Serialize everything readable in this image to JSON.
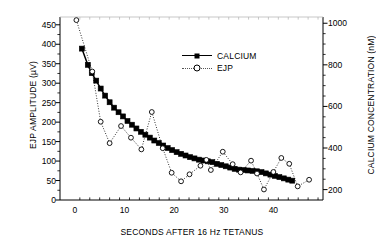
{
  "chart_data": {
    "type": "line",
    "title": "",
    "xlabel": "SECONDS AFTER 16 Hz TETANUS",
    "ylabel": "EJP AMPLITUDE  (µV)",
    "y2label": "CALCIUM CONCENTRATION  (nM)",
    "xlim": [
      -3,
      50
    ],
    "ylim": [
      0,
      470
    ],
    "y2lim": [
      150,
      1030
    ],
    "grid": false,
    "legend_position": "upper-right-inside",
    "xticks": [
      0,
      10,
      20,
      30,
      40
    ],
    "xtick_labels": [
      "0",
      "10",
      "20",
      "30",
      "40"
    ],
    "xminor_step": 2,
    "yticks": [
      0,
      50,
      100,
      150,
      200,
      250,
      300,
      350,
      400,
      450
    ],
    "ytick_labels": [
      "0",
      "50",
      "100",
      "150",
      "200",
      "250",
      "300",
      "350",
      "400",
      "450"
    ],
    "y2ticks": [
      200,
      400,
      600,
      800,
      1000
    ],
    "y2tick_labels": [
      "200",
      "400",
      "600",
      "800",
      "1000"
    ],
    "series": [
      {
        "name": "CALCIUM",
        "axis": "right",
        "marker": "filled-square",
        "line": "solid",
        "color": "#000000",
        "points": [
          [
            1.4,
            878
          ],
          [
            2.6,
            800
          ],
          [
            3.4,
            760
          ],
          [
            4.3,
            724
          ],
          [
            5.2,
            686
          ],
          [
            6.1,
            652
          ],
          [
            7.0,
            620
          ],
          [
            7.9,
            594
          ],
          [
            8.8,
            572
          ],
          [
            9.7,
            552
          ],
          [
            10.6,
            530
          ],
          [
            11.5,
            512
          ],
          [
            12.4,
            494
          ],
          [
            13.3,
            478
          ],
          [
            14.2,
            464
          ],
          [
            15.1,
            450
          ],
          [
            16.0,
            436
          ],
          [
            16.9,
            424
          ],
          [
            17.8,
            412
          ],
          [
            18.7,
            400
          ],
          [
            19.6,
            390
          ],
          [
            20.5,
            380
          ],
          [
            21.4,
            372
          ],
          [
            22.3,
            364
          ],
          [
            23.2,
            356
          ],
          [
            24.1,
            350
          ],
          [
            25.0,
            344
          ],
          [
            25.9,
            340
          ],
          [
            26.8,
            336
          ],
          [
            27.7,
            332
          ],
          [
            28.6,
            324
          ],
          [
            29.5,
            318
          ],
          [
            30.4,
            312
          ],
          [
            31.3,
            306
          ],
          [
            32.2,
            300
          ],
          [
            33.1,
            296
          ],
          [
            34.0,
            294
          ],
          [
            34.9,
            292
          ],
          [
            35.8,
            290
          ],
          [
            36.7,
            288
          ],
          [
            37.6,
            284
          ],
          [
            38.5,
            278
          ],
          [
            39.4,
            272
          ],
          [
            40.3,
            266
          ],
          [
            41.2,
            260
          ],
          [
            42.1,
            254
          ],
          [
            43.0,
            248
          ],
          [
            43.8,
            243
          ]
        ]
      },
      {
        "name": "EJP",
        "axis": "left",
        "marker": "open-circle",
        "line": "dotted",
        "color": "#000000",
        "points": [
          [
            0.3,
            462
          ],
          [
            3.5,
            330
          ],
          [
            5.2,
            201
          ],
          [
            7.0,
            146
          ],
          [
            9.3,
            190
          ],
          [
            11.3,
            160
          ],
          [
            13.4,
            130
          ],
          [
            15.5,
            226
          ],
          [
            17.7,
            133
          ],
          [
            19.5,
            70
          ],
          [
            21.4,
            48
          ],
          [
            23.1,
            66
          ],
          [
            25.3,
            88
          ],
          [
            26.5,
            103
          ],
          [
            27.4,
            77
          ],
          [
            29.8,
            124
          ],
          [
            31.8,
            92
          ],
          [
            33.4,
            71
          ],
          [
            35.5,
            101
          ],
          [
            36.7,
            68
          ],
          [
            38.1,
            27
          ],
          [
            40.0,
            72
          ],
          [
            41.6,
            108
          ],
          [
            43.2,
            93
          ],
          [
            44.9,
            35
          ],
          [
            47.2,
            52
          ]
        ]
      }
    ]
  },
  "legend": {
    "items": [
      {
        "label": "CALCIUM",
        "marker": "filled-square",
        "line": "solid"
      },
      {
        "label": "EJP",
        "marker": "open-circle",
        "line": "dotted"
      }
    ]
  },
  "axis_titles": {
    "left": "EJP AMPLITUDE  (µV)",
    "right": "CALCIUM CONCENTRATION  (nM)",
    "bottom": "SECONDS AFTER 16 Hz TETANUS"
  }
}
